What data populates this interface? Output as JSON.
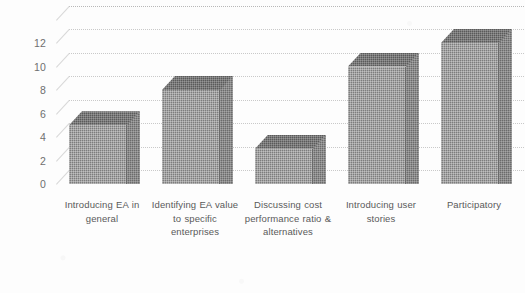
{
  "chart_data": {
    "type": "bar",
    "title": "",
    "subtitle": "",
    "xlabel": "",
    "ylabel": "",
    "categories": [
      "Introducing EA in general",
      "Identifying EA value to specific enterprises",
      "Discussing cost performance ratio & alternatives",
      "Introducing user stories",
      "Participatory"
    ],
    "values": [
      5,
      8,
      3,
      10,
      12
    ],
    "ylim": [
      0,
      12
    ],
    "ytick_labels": [
      "0",
      "2",
      "4",
      "6",
      "8",
      "10",
      "12"
    ],
    "ytick_values": [
      0,
      2,
      4,
      6,
      8,
      10,
      12
    ],
    "grid": true,
    "legend": "none",
    "style": "3d-column",
    "bar_color": "#7d7d7d",
    "bar_top_color": "#5a5a5a",
    "bar_side_color": "#6b6b6b",
    "gridline_color": "#c9c9c9",
    "tick_label_color": "#6f6f6f",
    "category_label_color": "#5a5a5a",
    "background_color": "#fdfdfd"
  }
}
